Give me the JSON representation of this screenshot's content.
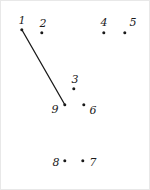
{
  "puzzle": {
    "title": "Connect the dots",
    "background_color": "#ffffff",
    "ink_color": "#1a1a1a",
    "width": 150,
    "height": 190,
    "dot_radius": 1.7,
    "dots": [
      {
        "label": "1",
        "dot_x": 21,
        "dot_y": 29,
        "label_x": 21,
        "label_y": 19
      },
      {
        "label": "2",
        "dot_x": 41,
        "dot_y": 32,
        "label_x": 42,
        "label_y": 22
      },
      {
        "label": "3",
        "dot_x": 73,
        "dot_y": 88,
        "label_x": 74,
        "label_y": 78
      },
      {
        "label": "4",
        "dot_x": 103,
        "dot_y": 32,
        "label_x": 103,
        "label_y": 21
      },
      {
        "label": "5",
        "dot_x": 124,
        "dot_y": 32,
        "label_x": 132,
        "label_y": 21
      },
      {
        "label": "6",
        "dot_x": 83,
        "dot_y": 104,
        "label_x": 92,
        "label_y": 109
      },
      {
        "label": "7",
        "dot_x": 82,
        "dot_y": 160,
        "label_x": 92,
        "label_y": 161
      },
      {
        "label": "8",
        "dot_x": 64,
        "dot_y": 160,
        "label_x": 55,
        "label_y": 161
      },
      {
        "label": "9",
        "dot_x": 64,
        "dot_y": 104,
        "label_x": 54,
        "label_y": 108
      }
    ],
    "lines": [
      {
        "from": "1",
        "to": "9",
        "x1": 21,
        "y1": 29,
        "x2": 64,
        "y2": 104,
        "stroke_width": 1.3
      }
    ]
  }
}
